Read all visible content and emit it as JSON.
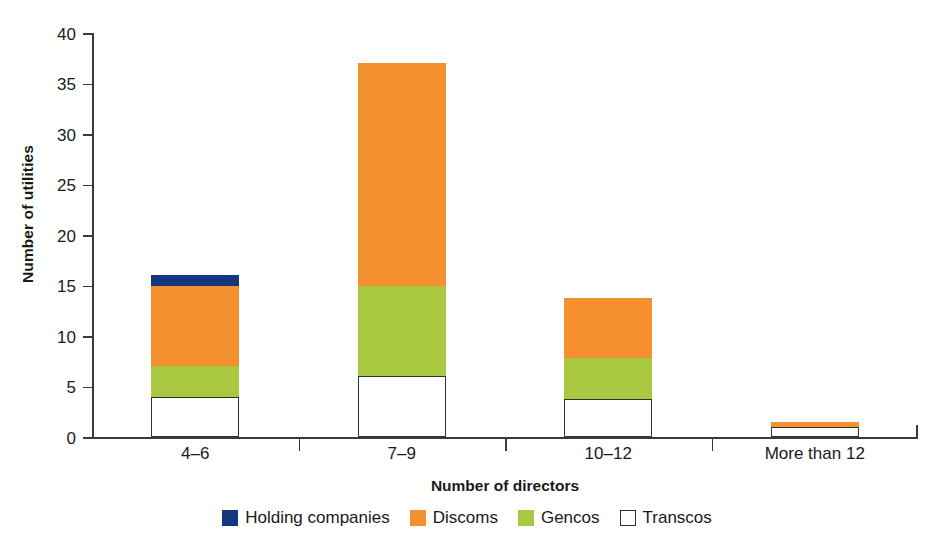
{
  "chart_data": {
    "type": "bar",
    "subtype": "stacked-vertical",
    "title": "",
    "xlabel": "Number of directors",
    "ylabel": "Number of utilities",
    "categories": [
      "4–6",
      "7–9",
      "10–12",
      "More than 12"
    ],
    "ylim": [
      0,
      40
    ],
    "yticks": [
      0,
      5,
      10,
      15,
      20,
      25,
      30,
      35,
      40
    ],
    "grid": false,
    "legend_position": "bottom",
    "stack_order_bottom_to_top": [
      "Transcos",
      "Gencos",
      "Discoms",
      "Holding companies"
    ],
    "series": [
      {
        "name": "Transcos",
        "color": "#ffffff",
        "border_color": "#333333",
        "values": [
          4,
          6,
          3.8,
          1
        ]
      },
      {
        "name": "Gencos",
        "color": "#a9c83f",
        "values": [
          3,
          9,
          4,
          0
        ]
      },
      {
        "name": "Discoms",
        "color": "#f4902f",
        "values": [
          8,
          22,
          6,
          0.5
        ]
      },
      {
        "name": "Holding companies",
        "color": "#14377d",
        "values": [
          1,
          0,
          0,
          0
        ]
      }
    ],
    "totals": [
      16,
      37,
      13.8,
      1.5
    ]
  },
  "axes": {
    "y_title": "Number of utilities",
    "x_title": "Number of directors",
    "y_tick_labels": [
      "0",
      "5",
      "10",
      "15",
      "20",
      "25",
      "30",
      "35",
      "40"
    ],
    "x_tick_labels": [
      "4–6",
      "7–9",
      "10–12",
      "More than 12"
    ]
  },
  "legend": {
    "items": [
      {
        "label": "Holding companies",
        "swatch": "holding"
      },
      {
        "label": "Discoms",
        "swatch": "discoms"
      },
      {
        "label": "Gencos",
        "swatch": "gencos"
      },
      {
        "label": "Transcos",
        "swatch": "transcos"
      }
    ]
  },
  "colors": {
    "holding_companies": "#14377d",
    "discoms": "#f4902f",
    "gencos": "#a9c83f",
    "transcos": "#ffffff",
    "axis": "#3a3a3a",
    "text": "#1a1a1a"
  }
}
